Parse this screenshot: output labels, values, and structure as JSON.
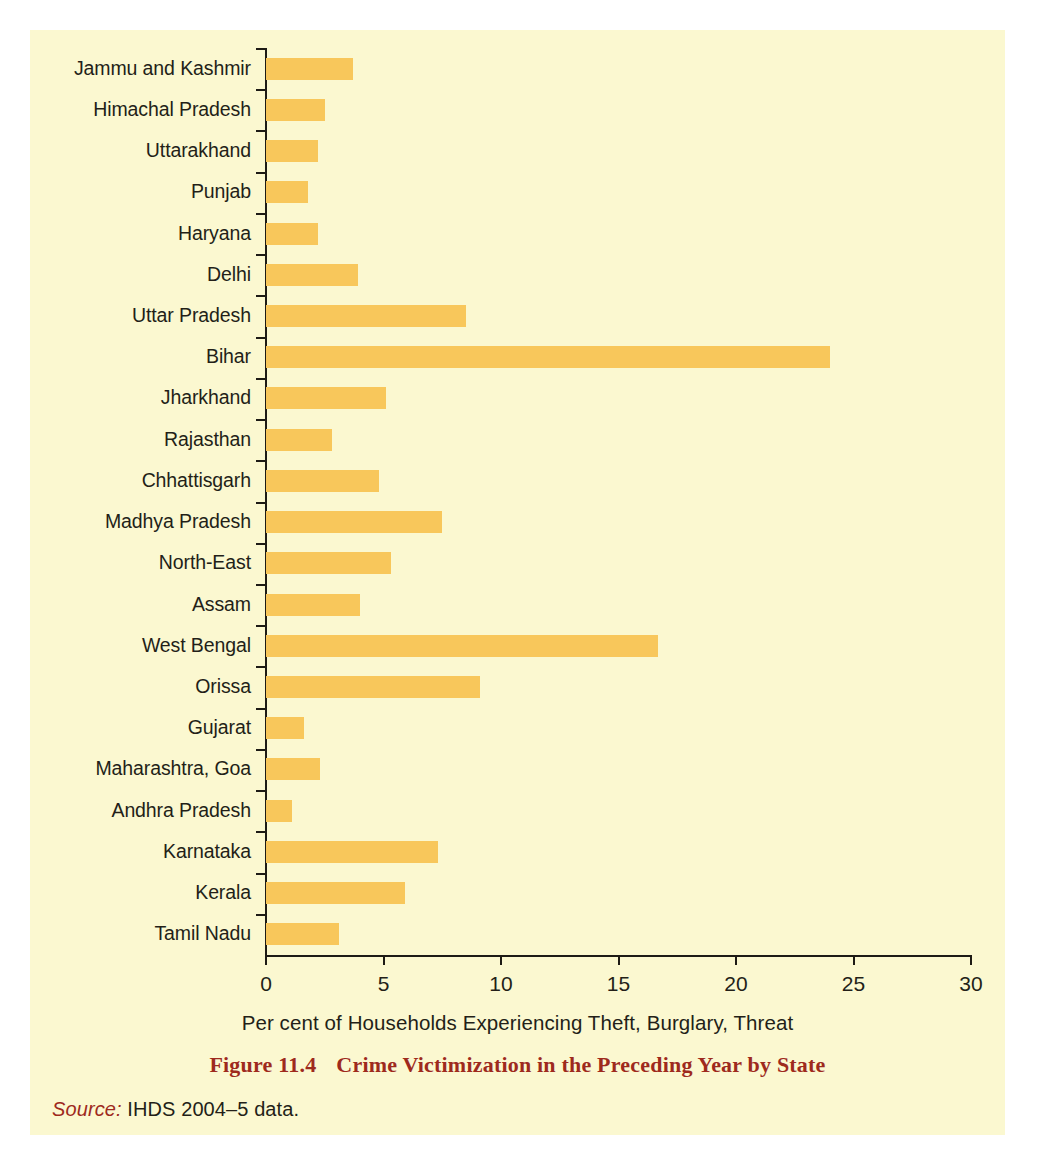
{
  "figure": {
    "caption_number": "Figure 11.4",
    "caption_text": "Crime Victimization in the Preceding Year by State",
    "source_label": "Source:",
    "source_text": "IHDS 2004–5 data.",
    "panel_color": "#fbf8d0",
    "caption_color": "#9e2a1d",
    "bar_color": "#f8c75b"
  },
  "chart_data": {
    "type": "bar",
    "orientation": "horizontal",
    "title": "Crime Victimization in the Preceding Year by State",
    "xlabel": "Per cent of Households Experiencing Theft, Burglary, Threat",
    "ylabel": "",
    "xlim": [
      0,
      30
    ],
    "xticks": [
      0,
      5,
      10,
      15,
      20,
      25,
      30
    ],
    "xtick_labels": [
      "0",
      "5",
      "10",
      "15",
      "20",
      "25",
      "30"
    ],
    "grid": false,
    "legend": false,
    "categories": [
      "Jammu and Kashmir",
      "Himachal Pradesh",
      "Uttarakhand",
      "Punjab",
      "Haryana",
      "Delhi",
      "Uttar Pradesh",
      "Bihar",
      "Jharkhand",
      "Rajasthan",
      "Chhattisgarh",
      "Madhya Pradesh",
      "North-East",
      "Assam",
      "West Bengal",
      "Orissa",
      "Gujarat",
      "Maharashtra, Goa",
      "Andhra Pradesh",
      "Karnataka",
      "Kerala",
      "Tamil Nadu"
    ],
    "values": [
      3.7,
      2.5,
      2.2,
      1.8,
      2.2,
      3.9,
      8.5,
      24.0,
      5.1,
      2.8,
      4.8,
      7.5,
      5.3,
      4.0,
      16.7,
      9.1,
      1.6,
      2.3,
      1.1,
      7.3,
      5.9,
      3.1
    ]
  }
}
